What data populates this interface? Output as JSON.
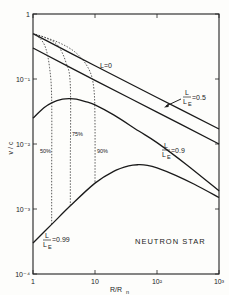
{
  "chart_data": {
    "type": "line",
    "title": "",
    "xlabel": "R/R_n",
    "ylabel": "v / c",
    "xscale": "log",
    "yscale": "log",
    "xlim": [
      1,
      1000
    ],
    "ylim": [
      0.0001,
      1
    ],
    "grid": false,
    "x_ticks": [
      {
        "value": 1,
        "label": "1"
      },
      {
        "value": 10,
        "label": "10"
      },
      {
        "value": 100,
        "label": "10²"
      },
      {
        "value": 1000,
        "label": "10³"
      }
    ],
    "y_ticks": [
      {
        "value": 1,
        "label": "1"
      },
      {
        "value": 0.1,
        "label": "10⁻¹"
      },
      {
        "value": 0.01,
        "label": "10⁻²"
      },
      {
        "value": 0.001,
        "label": "10⁻³"
      },
      {
        "value": 0.0001,
        "label": "10⁻⁴"
      }
    ],
    "series": [
      {
        "name": "L=0",
        "style": "solid",
        "x": [
          1,
          10,
          100,
          1000
        ],
        "y": [
          0.5,
          0.16,
          0.052,
          0.017
        ]
      },
      {
        "name": "L/L_E=0.5",
        "style": "solid",
        "x": [
          1,
          10,
          100,
          1000
        ],
        "y": [
          0.3,
          0.095,
          0.031,
          0.01
        ]
      },
      {
        "name": "L/L_E=0.9",
        "style": "solid",
        "x": [
          1,
          1.5,
          2,
          3,
          4,
          5,
          7,
          10,
          20,
          50,
          100,
          300,
          1000
        ],
        "y": [
          0.025,
          0.036,
          0.043,
          0.049,
          0.05,
          0.049,
          0.045,
          0.04,
          0.028,
          0.016,
          0.0105,
          0.0048,
          0.0019
        ]
      },
      {
        "name": "L/L_E=0.99",
        "style": "solid",
        "x": [
          1,
          2,
          4,
          10,
          20,
          35,
          50,
          70,
          100,
          200,
          400,
          1000
        ],
        "y": [
          0.0003,
          0.00058,
          0.00112,
          0.0025,
          0.0038,
          0.0046,
          0.0048,
          0.0047,
          0.0043,
          0.0033,
          0.0024,
          0.0015
        ]
      }
    ],
    "dotted_curves": [
      {
        "name": "50%",
        "x": [
          1,
          1.3,
          1.6,
          1.85,
          2,
          2,
          2
        ],
        "y": [
          0.5,
          0.42,
          0.3,
          0.15,
          0.05,
          0.003,
          0.00058
        ]
      },
      {
        "name": "75%",
        "x": [
          1,
          1.6,
          2.5,
          3.4,
          4,
          4,
          4
        ],
        "y": [
          0.5,
          0.43,
          0.33,
          0.18,
          0.08,
          0.005,
          0.00112
        ]
      },
      {
        "name": "90%",
        "x": [
          1,
          2.5,
          5,
          8,
          9.6,
          10,
          10
        ],
        "y": [
          0.5,
          0.37,
          0.25,
          0.14,
          0.07,
          0.02,
          0.0025
        ]
      }
    ],
    "annotations": [
      {
        "text": "L=0"
      },
      {
        "text": "L/L_E=0.5",
        "arrow": true
      },
      {
        "text": "L/L_E=0.9"
      },
      {
        "text": "L/L_E=0.99"
      },
      {
        "text": "50%"
      },
      {
        "text": "75%"
      },
      {
        "text": "90%"
      },
      {
        "text": "NEUTRON STAR"
      }
    ]
  },
  "labels": {
    "l0": "L=0",
    "frac_L": "L",
    "frac_LE": "L",
    "frac_E": "E",
    "v05": "=0.5",
    "v09": "=0.9",
    "v099": "=0.99",
    "p50": "50%",
    "p75": "75%",
    "p90": "90%",
    "star": "NEUTRON STAR",
    "xlabel_main": "R/R",
    "xlabel_sub": "n",
    "ylabel": "v / c"
  }
}
